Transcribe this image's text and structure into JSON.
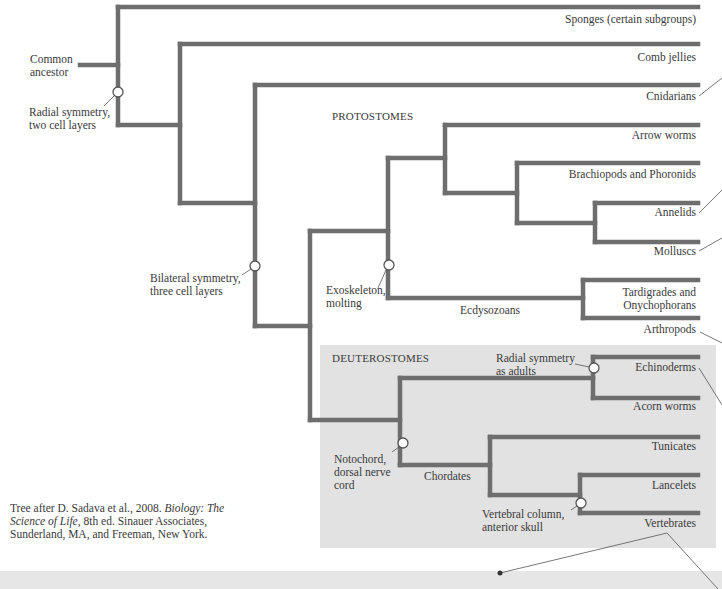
{
  "diagram": {
    "type": "phylogenetic-tree",
    "root_label": [
      "Common",
      "ancestor"
    ],
    "groups": {
      "protostomes_label": "PROTOSTOMES",
      "deuterostomes_label": "DEUTEROSTOMES",
      "ecdysozoans_label": "Ecdysozoans",
      "chordates_label": "Chordates"
    },
    "taxa": [
      {
        "id": "sponges",
        "label": "Sponges (certain subgroups)"
      },
      {
        "id": "comb-jellies",
        "label": "Comb jellies"
      },
      {
        "id": "cnidarians",
        "label": "Cnidarians"
      },
      {
        "id": "arrow-worms",
        "label": "Arrow worms"
      },
      {
        "id": "brachiopods",
        "label": "Brachiopods and Phoronids"
      },
      {
        "id": "annelids",
        "label": "Annelids"
      },
      {
        "id": "molluscs",
        "label": "Molluscs"
      },
      {
        "id": "tardigrades",
        "label": [
          "Tardigrades and",
          "Onychophorans"
        ]
      },
      {
        "id": "arthropods",
        "label": "Arthropods"
      },
      {
        "id": "echinoderms",
        "label": "Echinoderms"
      },
      {
        "id": "acorn-worms",
        "label": "Acorn worms"
      },
      {
        "id": "tunicates",
        "label": "Tunicates"
      },
      {
        "id": "lancelets",
        "label": "Lancelets"
      },
      {
        "id": "vertebrates",
        "label": "Vertebrates"
      }
    ],
    "traits": {
      "radial": [
        "Radial symmetry,",
        "two cell layers"
      ],
      "bilateral": [
        "Bilateral symmetry,",
        "three cell layers"
      ],
      "exoskeleton": [
        "Exoskeleton,",
        "molting"
      ],
      "radial_adults": [
        "Radial symmetry",
        "as adults"
      ],
      "notochord": [
        "Notochord,",
        "dorsal nerve",
        "cord"
      ],
      "vertebral": [
        "Vertebral column,",
        "anterior skull"
      ]
    },
    "credit": {
      "prefix": "Tree after D. Sadava et al., 2008. ",
      "title": "Biology: The Science of Life",
      "suffix": ", 8th ed. Sinauer Associates, Sunderland, MA, and Freeman, New York."
    },
    "colors": {
      "branch": "#6e6e6e",
      "deuterostome_box": "#e2e2e2",
      "bottom_bar": "#e6e6e6",
      "text": "#3a3a3a"
    }
  }
}
